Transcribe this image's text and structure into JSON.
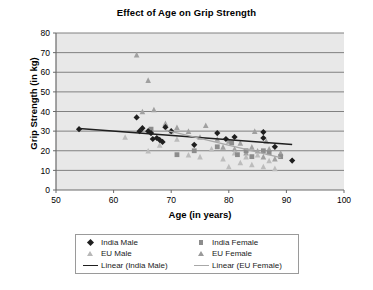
{
  "chart_data": {
    "type": "scatter",
    "title": "Effect of Age on Grip Strength",
    "xlabel": "Age (in years)",
    "ylabel": "Grip Strength (in kg)",
    "xlim": [
      50,
      100
    ],
    "ylim": [
      0,
      80
    ],
    "xticks": [
      50,
      60,
      70,
      80,
      90,
      100
    ],
    "yticks": [
      0,
      10,
      20,
      30,
      40,
      50,
      60,
      70,
      80
    ],
    "grid": "horizontal",
    "legend_position": "bottom",
    "plot_background": "#e8e8e8",
    "gridline_color": "#808080",
    "series": [
      {
        "name": "India Male",
        "marker": "diamond",
        "color": "#1f1f1f",
        "points": [
          [
            54,
            31
          ],
          [
            64,
            37
          ],
          [
            64.5,
            30
          ],
          [
            65,
            31.5
          ],
          [
            66,
            30
          ],
          [
            66.5,
            29
          ],
          [
            66.8,
            26
          ],
          [
            67.5,
            26.5
          ],
          [
            68,
            25.5
          ],
          [
            68.5,
            24.5
          ],
          [
            69,
            32
          ],
          [
            70,
            30
          ],
          [
            74,
            23
          ],
          [
            78,
            29
          ],
          [
            79.5,
            26
          ],
          [
            81,
            27
          ],
          [
            86,
            29.5
          ],
          [
            86,
            26.5
          ],
          [
            88,
            22
          ],
          [
            91,
            15
          ]
        ]
      },
      {
        "name": "India Female",
        "marker": "square",
        "color": "#8c8c8c",
        "points": [
          [
            66.5,
            31
          ],
          [
            71,
            18
          ],
          [
            74,
            20
          ],
          [
            78,
            22
          ],
          [
            80.5,
            24
          ],
          [
            81.5,
            18
          ],
          [
            83,
            20
          ],
          [
            84,
            17
          ],
          [
            86,
            20
          ],
          [
            87,
            19
          ],
          [
            89,
            17
          ]
        ]
      },
      {
        "name": "EU Male",
        "marker": "triangle",
        "color": "#bcbcbc",
        "points": [
          [
            62,
            27
          ],
          [
            66,
            20
          ],
          [
            68,
            23
          ],
          [
            70,
            30
          ],
          [
            71,
            26
          ],
          [
            73,
            18
          ],
          [
            75,
            17
          ],
          [
            77,
            21
          ],
          [
            79,
            16
          ],
          [
            80,
            12
          ],
          [
            81,
            19
          ],
          [
            82,
            14
          ],
          [
            83,
            17
          ],
          [
            84,
            13
          ],
          [
            85,
            18
          ],
          [
            86,
            12
          ],
          [
            87,
            15
          ],
          [
            88,
            11
          ]
        ]
      },
      {
        "name": "EU Female",
        "marker": "triangle",
        "color": "#a0a0a0",
        "points": [
          [
            64,
            69
          ],
          [
            66,
            56
          ],
          [
            65,
            40
          ],
          [
            67,
            41
          ],
          [
            69,
            34
          ],
          [
            71,
            32
          ],
          [
            73,
            30
          ],
          [
            75,
            27
          ],
          [
            76,
            33
          ],
          [
            78,
            26
          ],
          [
            79,
            22
          ],
          [
            80,
            25
          ],
          [
            81,
            21
          ],
          [
            82,
            24
          ],
          [
            83,
            19
          ],
          [
            84,
            22
          ],
          [
            85,
            20
          ],
          [
            86,
            17
          ],
          [
            87,
            21
          ],
          [
            88,
            16
          ],
          [
            89,
            19
          ],
          [
            84.5,
            30
          ],
          [
            86.5,
            25
          ]
        ]
      }
    ],
    "trendlines": [
      {
        "name": "Linear (India Male)",
        "color": "#1f1f1f",
        "x1": 54,
        "y1": 31.3,
        "x2": 91,
        "y2": 23.2
      },
      {
        "name": "Linear (EU Female)",
        "color": "#a8a8a8",
        "x1": 69,
        "y1": 30.5,
        "x2": 89,
        "y2": 16.5
      }
    ]
  },
  "legend": {
    "entries": [
      {
        "label": "India Male",
        "marker": "diamond"
      },
      {
        "label": "India Female",
        "marker": "square"
      },
      {
        "label": "EU Male",
        "marker": "triangle-light"
      },
      {
        "label": "EU Female",
        "marker": "triangle-dark"
      },
      {
        "label": "Linear (India Male)",
        "marker": "line-dark"
      },
      {
        "label": "Linear (EU Female)",
        "marker": "line-gray"
      }
    ]
  }
}
